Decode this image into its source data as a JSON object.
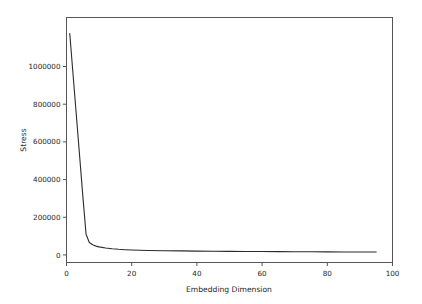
{
  "chart_data": {
    "type": "line",
    "title": "",
    "xlabel": "Embedding Dimension",
    "ylabel": "Stress",
    "xlim": [
      0,
      100
    ],
    "ylim": [
      -40000,
      1260000
    ],
    "grid": false,
    "legend": null,
    "line_color": "#2b2b2b",
    "line_width": 1.1,
    "x_ticks": [
      0,
      20,
      40,
      60,
      80,
      100
    ],
    "x_tick_labels": [
      "0",
      "20",
      "40",
      "60",
      "80",
      "100"
    ],
    "y_ticks": [
      0,
      200000,
      400000,
      600000,
      800000,
      1000000
    ],
    "y_tick_labels": [
      "0",
      "200000",
      "400000",
      "600000",
      "800000",
      "1000000"
    ],
    "series": [
      {
        "name": "stress",
        "x": [
          1,
          2,
          3,
          4,
          5,
          6,
          7,
          8,
          9,
          10,
          12,
          14,
          16,
          18,
          20,
          25,
          30,
          35,
          40,
          45,
          50,
          55,
          60,
          65,
          70,
          75,
          80,
          85,
          90,
          95
        ],
        "values": [
          1175000,
          960000,
          745000,
          530000,
          315000,
          110000,
          66000,
          54000,
          47000,
          43000,
          37000,
          33000,
          30000,
          28000,
          26500,
          24000,
          22500,
          21500,
          20500,
          19800,
          19200,
          18600,
          18100,
          17600,
          17200,
          16800,
          16400,
          16100,
          15800,
          15500
        ]
      }
    ]
  },
  "figure": {
    "background": "#ffffff",
    "axes_color": "#555555"
  }
}
